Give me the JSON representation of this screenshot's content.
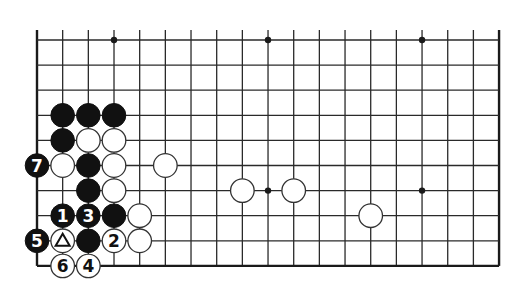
{
  "diagram": {
    "type": "go-board-fragment",
    "background": "#ffffff",
    "grid": {
      "origin_x": 37,
      "origin_y": 40,
      "spacing_x": 25.67,
      "spacing_y": 25.1,
      "columns": 19,
      "rows": 10,
      "top_lines_extend": true,
      "edges": [
        "left",
        "right",
        "bottom"
      ]
    },
    "hoshi": [
      {
        "col": 3,
        "row": 0
      },
      {
        "col": 9,
        "row": 0
      },
      {
        "col": 15,
        "row": 0
      },
      {
        "col": 9,
        "row": 6
      },
      {
        "col": 15,
        "row": 6
      }
    ],
    "stones": [
      {
        "col": 1,
        "row": 3,
        "color": "black",
        "label": ""
      },
      {
        "col": 2,
        "row": 3,
        "color": "black",
        "label": ""
      },
      {
        "col": 3,
        "row": 3,
        "color": "black",
        "label": ""
      },
      {
        "col": 1,
        "row": 4,
        "color": "black",
        "label": ""
      },
      {
        "col": 2,
        "row": 4,
        "color": "white",
        "label": ""
      },
      {
        "col": 3,
        "row": 4,
        "color": "white",
        "label": ""
      },
      {
        "col": 0,
        "row": 5,
        "color": "black",
        "label": "7"
      },
      {
        "col": 1,
        "row": 5,
        "color": "white",
        "label": ""
      },
      {
        "col": 2,
        "row": 5,
        "color": "black",
        "label": ""
      },
      {
        "col": 3,
        "row": 5,
        "color": "white",
        "label": ""
      },
      {
        "col": 5,
        "row": 5,
        "color": "white",
        "label": ""
      },
      {
        "col": 2,
        "row": 6,
        "color": "black",
        "label": ""
      },
      {
        "col": 3,
        "row": 6,
        "color": "white",
        "label": ""
      },
      {
        "col": 8,
        "row": 6,
        "color": "white",
        "label": ""
      },
      {
        "col": 10,
        "row": 6,
        "color": "white",
        "label": ""
      },
      {
        "col": 1,
        "row": 7,
        "color": "black",
        "label": "1"
      },
      {
        "col": 2,
        "row": 7,
        "color": "black",
        "label": "3"
      },
      {
        "col": 3,
        "row": 7,
        "color": "black",
        "label": ""
      },
      {
        "col": 4,
        "row": 7,
        "color": "white",
        "label": ""
      },
      {
        "col": 13,
        "row": 7,
        "color": "white",
        "label": ""
      },
      {
        "col": 0,
        "row": 8,
        "color": "black",
        "label": "5"
      },
      {
        "col": 1,
        "row": 8,
        "color": "white",
        "label": "",
        "mark": "triangle"
      },
      {
        "col": 2,
        "row": 8,
        "color": "black",
        "label": ""
      },
      {
        "col": 3,
        "row": 8,
        "color": "white",
        "label": "2"
      },
      {
        "col": 4,
        "row": 8,
        "color": "white",
        "label": ""
      },
      {
        "col": 1,
        "row": 9,
        "color": "white",
        "label": "6"
      },
      {
        "col": 2,
        "row": 9,
        "color": "white",
        "label": "4"
      }
    ],
    "move_sequence": [
      {
        "number": "1",
        "color": "black"
      },
      {
        "number": "2",
        "color": "white"
      },
      {
        "number": "3",
        "color": "black"
      },
      {
        "number": "4",
        "color": "white"
      },
      {
        "number": "5",
        "color": "black"
      },
      {
        "number": "6",
        "color": "white"
      },
      {
        "number": "7",
        "color": "black"
      }
    ]
  }
}
